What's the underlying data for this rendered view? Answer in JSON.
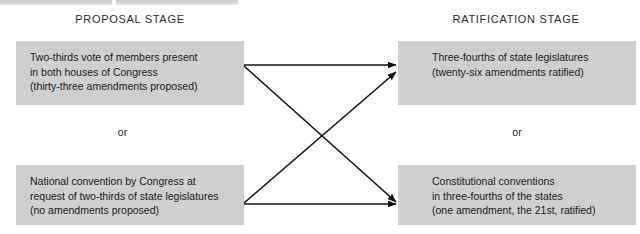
{
  "diagram": {
    "title_implicit": "Amending the Constitution: Proposal and Ratification",
    "headings": {
      "left": "PROPOSAL STAGE",
      "right": "RATIFICATION STAGE"
    },
    "or_left": "or",
    "or_right": "or",
    "colors": {
      "box_fill": "#cfcfcf",
      "text": "#1c1c1c",
      "heading_text": "#2b2b2b",
      "arrow": "#111111",
      "background": "#ffffff"
    },
    "boxes": {
      "proposal_top": {
        "line1": "Two-thirds vote of members present",
        "line2": "in both houses of Congress",
        "line3": "(thirty-three amendments proposed)"
      },
      "proposal_bottom": {
        "line1": "National convention by Congress at",
        "line2": "request of two-thirds of state legislatures",
        "line3": "(no amendments proposed)"
      },
      "ratification_top": {
        "line1": "Three-fourths of state legislatures",
        "line2": "(twenty-six amendments ratified)",
        "line3": ""
      },
      "ratification_bottom": {
        "line1": "Constitutional conventions",
        "line2": "in three-fourths of the states",
        "line3": "(one amendment, the 21st, ratified)"
      }
    },
    "connections": [
      {
        "name": "proposal-top-to-ratification-top",
        "from": "proposal_top",
        "to": "ratification_top"
      },
      {
        "name": "proposal-top-to-ratification-bottom",
        "from": "proposal_top",
        "to": "ratification_bottom"
      },
      {
        "name": "proposal-bottom-to-ratification-top",
        "from": "proposal_bottom",
        "to": "ratification_top"
      },
      {
        "name": "proposal-bottom-to-ratification-bottom",
        "from": "proposal_bottom",
        "to": "ratification_bottom"
      }
    ]
  }
}
